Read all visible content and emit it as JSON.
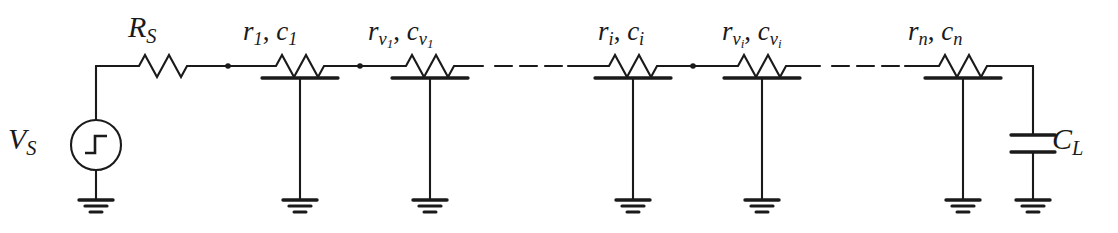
{
  "figure": {
    "width": 1118,
    "height": 233,
    "background_color": "#ffffff",
    "line_color": "#1a1a1a"
  },
  "source": {
    "name": "step-voltage-source",
    "label_main": "V",
    "label_sub": "S",
    "symbol": "step-function-in-circle",
    "center_x": 96,
    "center_y": 145,
    "radius": 25
  },
  "series_resistor": {
    "name": "source-resistance",
    "label_main": "R",
    "label_sub": "S",
    "x_start": 133,
    "x_end": 193
  },
  "rc_sections": [
    {
      "id": "rc-1",
      "r_label": "r",
      "r_sub": "1",
      "r_sub2": "",
      "c_label": "c",
      "c_sub": "1",
      "c_sub2": "",
      "text": "r1, c1",
      "x_center": 300
    },
    {
      "id": "rc-v1",
      "r_label": "r",
      "r_sub": "v",
      "r_sub2": "1",
      "c_label": "c",
      "c_sub": "v",
      "c_sub2": "1",
      "text": "rv1, cv1",
      "x_center": 430
    },
    {
      "id": "rc-i",
      "r_label": "r",
      "r_sub": "i",
      "r_sub2": "",
      "c_label": "c",
      "c_sub": "i",
      "c_sub2": "",
      "text": "ri, ci",
      "x_center": 633
    },
    {
      "id": "rc-vi",
      "r_label": "r",
      "r_sub": "v",
      "r_sub2": "i",
      "c_label": "c",
      "c_sub": "v",
      "c_sub2": "i",
      "text": "rvi, cvi",
      "x_center": 762
    },
    {
      "id": "rc-n",
      "r_label": "r",
      "r_sub": "n",
      "r_sub2": "",
      "c_label": "c",
      "c_sub": "n",
      "c_sub2": "",
      "text": "rn, cn",
      "x_center": 963
    }
  ],
  "load_capacitor": {
    "name": "load-capacitance",
    "label_main": "C",
    "label_sub": "L",
    "x": 1033,
    "plate_top_y": 135,
    "plate_bottom_y": 152
  },
  "ellipses": [
    {
      "id": "ellipsis-left",
      "x_start": 483,
      "x_end": 568,
      "dashes": 3
    },
    {
      "id": "ellipsis-right",
      "x_start": 820,
      "x_end": 905,
      "dashes": 3
    }
  ],
  "nodes": [
    {
      "id": "node-1",
      "x": 228,
      "y": 66
    },
    {
      "id": "node-2",
      "x": 360,
      "y": 66
    },
    {
      "id": "node-3",
      "x": 693,
      "y": 66
    }
  ],
  "grounds": [
    {
      "id": "ground-source",
      "x": 96
    },
    {
      "id": "ground-rc-1",
      "x": 300
    },
    {
      "id": "ground-rc-v1",
      "x": 430
    },
    {
      "id": "ground-rc-i",
      "x": 633
    },
    {
      "id": "ground-rc-vi",
      "x": 762
    },
    {
      "id": "ground-rc-n",
      "x": 963
    },
    {
      "id": "ground-load",
      "x": 1033
    }
  ],
  "geometry": {
    "rail_y": 66,
    "plate_y": 78,
    "ground_y": 200
  }
}
